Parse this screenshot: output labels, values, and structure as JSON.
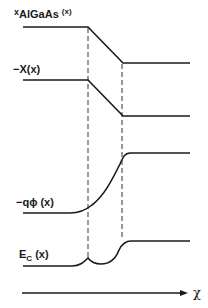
{
  "diagram": {
    "colors": {
      "line": "#1a1a1a",
      "background": "#ffffff"
    },
    "labels": {
      "x_algaas": {
        "prefix": "x",
        "main": "AlGaAs",
        "arg": "(x)"
      },
      "chi": {
        "text": "−Χ(x)"
      },
      "phi": {
        "text": "−qϕ (x)"
      },
      "ec": {
        "main": "E",
        "sub": "C",
        "arg": "(x)"
      },
      "axis": {
        "text": "χ"
      }
    },
    "curves": [
      {
        "name": "x_AlGaAs(x)",
        "shape": "step-down-linear",
        "left_level": 27,
        "right_level": 63
      },
      {
        "name": "-chi(x)",
        "shape": "step-down-linear",
        "left_level": 80,
        "right_level": 116
      },
      {
        "name": "-q phi(x)",
        "shape": "smooth-rise",
        "left_level": 213,
        "right_level": 153
      },
      {
        "name": "E_C(x)",
        "shape": "rise-with-notch",
        "left_level": 266,
        "right_level": 241
      }
    ],
    "interface_markers": [
      {
        "x": 88
      },
      {
        "x": 122
      }
    ]
  }
}
